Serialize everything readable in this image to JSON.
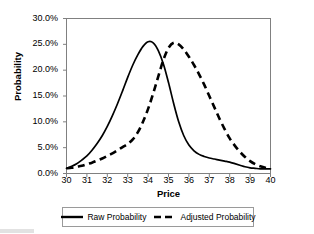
{
  "chart_data": {
    "type": "line",
    "title": "",
    "xlabel": "Price",
    "ylabel": "Probability",
    "xlim": [
      30,
      40
    ],
    "ylim": [
      0.0,
      0.3
    ],
    "grid": false,
    "legend_position": "bottom",
    "x_ticks": [
      30,
      31,
      32,
      33,
      34,
      35,
      36,
      37,
      38,
      39,
      40
    ],
    "x_tick_labels": [
      "30",
      "31",
      "32",
      "33",
      "34",
      "35",
      "36",
      "37",
      "38",
      "39",
      "40"
    ],
    "y_ticks": [
      0.0,
      0.05,
      0.1,
      0.15,
      0.2,
      0.25,
      0.3
    ],
    "y_tick_labels": [
      "0.0%",
      "5.0%",
      "10.0%",
      "15.0%",
      "20.0%",
      "25.0%",
      "30.0%"
    ],
    "x": [
      30.0,
      30.25,
      30.5,
      30.75,
      31.0,
      31.25,
      31.5,
      31.75,
      32.0,
      32.25,
      32.5,
      32.75,
      33.0,
      33.25,
      33.5,
      33.75,
      34.0,
      34.25,
      34.5,
      34.75,
      35.0,
      35.25,
      35.5,
      35.75,
      36.0,
      36.25,
      36.5,
      36.75,
      37.0,
      37.25,
      37.5,
      37.75,
      38.0,
      38.25,
      38.5,
      38.75,
      39.0,
      39.25,
      39.5,
      39.75,
      40.0
    ],
    "series": [
      {
        "name": "Raw Probability",
        "style": "solid",
        "color": "#000000",
        "peak_x": 34.0,
        "peak_y": 0.255,
        "values": [
          0.01,
          0.014,
          0.019,
          0.026,
          0.034,
          0.045,
          0.058,
          0.073,
          0.091,
          0.112,
          0.135,
          0.16,
          0.186,
          0.21,
          0.23,
          0.246,
          0.255,
          0.253,
          0.238,
          0.212,
          0.176,
          0.136,
          0.1,
          0.073,
          0.055,
          0.044,
          0.037,
          0.033,
          0.03,
          0.028,
          0.026,
          0.024,
          0.022,
          0.019,
          0.016,
          0.013,
          0.011,
          0.01,
          0.009,
          0.009,
          0.009
        ]
      },
      {
        "name": "Adjusted Probability",
        "style": "dashed",
        "color": "#000000",
        "peak_x": 35.25,
        "peak_y": 0.253,
        "values": [
          0.01,
          0.011,
          0.013,
          0.015,
          0.018,
          0.021,
          0.025,
          0.029,
          0.034,
          0.039,
          0.045,
          0.051,
          0.057,
          0.066,
          0.08,
          0.1,
          0.125,
          0.155,
          0.188,
          0.22,
          0.243,
          0.253,
          0.25,
          0.24,
          0.226,
          0.21,
          0.192,
          0.172,
          0.15,
          0.128,
          0.106,
          0.086,
          0.068,
          0.054,
          0.042,
          0.032,
          0.024,
          0.018,
          0.014,
          0.011,
          0.009
        ]
      }
    ]
  },
  "axes": {
    "ylabel": "Probability",
    "xlabel": "Price",
    "frame_color": "#808080"
  },
  "legend": {
    "entries": [
      {
        "label": "Raw Probability",
        "style": "solid"
      },
      {
        "label": "Adjusted Probability",
        "style": "dashed"
      }
    ]
  }
}
